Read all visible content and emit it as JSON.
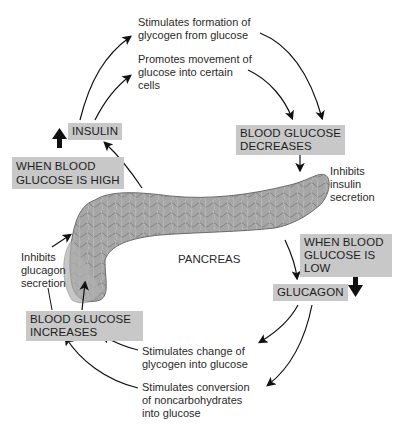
{
  "diagram": {
    "organ_label": "PANCREAS",
    "boxes": {
      "insulin": "INSULIN",
      "when_high": [
        "WHEN BLOOD",
        "GLUCOSE IS HIGH"
      ],
      "decreases": [
        "BLOOD GLUCOSE",
        "DECREASES"
      ],
      "when_low": [
        "WHEN BLOOD",
        "GLUCOSE IS",
        "LOW"
      ],
      "glucagon": "GLUCAGON",
      "increases": [
        "BLOOD GLUCOSE",
        "INCREASES"
      ]
    },
    "notes": {
      "glycogen_formation": [
        "Stimulates formation of",
        "glycogen from glucose"
      ],
      "glucose_movement": [
        "Promotes movement of",
        "glucose into certain",
        "cells"
      ],
      "inhibits_insulin": [
        "Inhibits",
        "insulin",
        "secretion"
      ],
      "inhibits_glucagon": [
        "Inhibits",
        "glucagon",
        "secretion"
      ],
      "glycogen_change": [
        "Stimulates change of",
        "glycogen into glucose"
      ],
      "noncarb_conversion": [
        "Stimulates conversion",
        "of noncarbohydrates",
        "into glucose"
      ]
    },
    "colors": {
      "box_fill": "#c8c8c8",
      "arrow": "#111111",
      "organ_fill": "#9a9a9a"
    }
  }
}
